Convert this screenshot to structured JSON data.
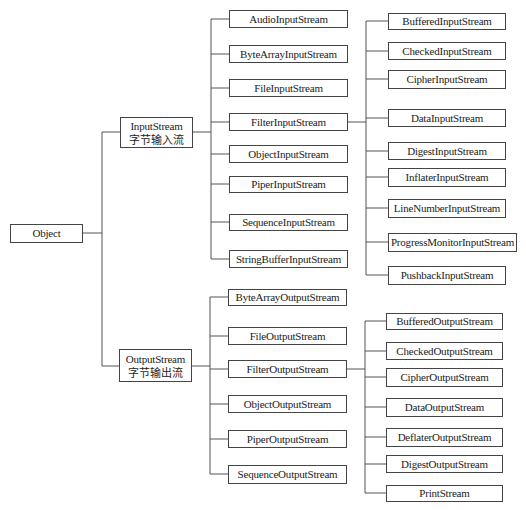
{
  "root": {
    "label": "Object"
  },
  "input": {
    "label": "InputStream",
    "sublabel": "字节输入流",
    "children": [
      "AudioInputStream",
      "ByteArrayInputStream",
      "FileInputStream",
      "FilterInputStream",
      "ObjectInputStream",
      "PiperInputStream",
      "SequenceInputStream",
      "StringBufferInputStream"
    ],
    "filter_children": [
      "BufferedInputStream",
      "CheckedInputStream",
      "CipherInputStream",
      "DataInputStream",
      "DigestInputStream",
      "InflaterInputStream",
      "LineNumberInputStream",
      "ProgressMonitorInputStream",
      "PushbackInputStream"
    ]
  },
  "output": {
    "label": "OutputStream",
    "sublabel": "字节输出流",
    "children": [
      "ByteArrayOutputStream",
      "FileOutputStream",
      "FilterOutputStream",
      "ObjectOutputStream",
      "PiperOutputStream",
      "SequenceOutputStream"
    ],
    "filter_children": [
      "BufferedOutputStream",
      "CheckedOutputStream",
      "CipherOutputStream",
      "DataOutputStream",
      "DeflaterOutputStream",
      "DigestOutputStream",
      "PrintStream"
    ]
  }
}
